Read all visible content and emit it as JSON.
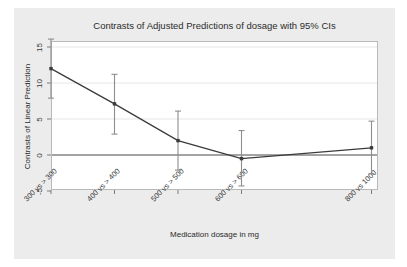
{
  "chart_data": {
    "type": "line",
    "title": "Contrasts of Adjusted Predictions of dosage with 95% CIs",
    "xlabel": "Medication dosage in mg",
    "ylabel": "Contrasts of Linear Prediction",
    "categories": [
      "300 vs > 300",
      "400 vs > 400",
      "500 vs > 500",
      "600 vs > 600",
      "800 vs 1000"
    ],
    "values": [
      12.0,
      7.1,
      2.0,
      -0.5,
      1.0
    ],
    "ci_lower": [
      7.9,
      2.9,
      -2.1,
      -4.3,
      -2.6
    ],
    "ci_upper": [
      16.1,
      11.2,
      6.1,
      3.4,
      4.7
    ],
    "ylim": [
      -6.5,
      17.0
    ],
    "yticks": [
      15,
      10,
      5,
      0,
      -5
    ],
    "ytick_labels": [
      "15",
      "10",
      "5",
      "0",
      "-5"
    ],
    "grid": true,
    "legend": null,
    "reference_line_y": 0,
    "marker": "square",
    "series_color": "#3b3b3b",
    "grid_color": "#e6e6e6",
    "background_color": "#ececec",
    "plot_background_color": "#ffffff"
  },
  "axes": {
    "y_tick_0": "15",
    "y_tick_1": "10",
    "y_tick_2": "5",
    "y_tick_3": "0",
    "y_tick_4": "-5",
    "x_tick_0": "300 vs > 300",
    "x_tick_1": "400 vs > 400",
    "x_tick_2": "500 vs > 500",
    "x_tick_3": "600 vs > 600",
    "x_tick_4": "800 vs 1000"
  }
}
